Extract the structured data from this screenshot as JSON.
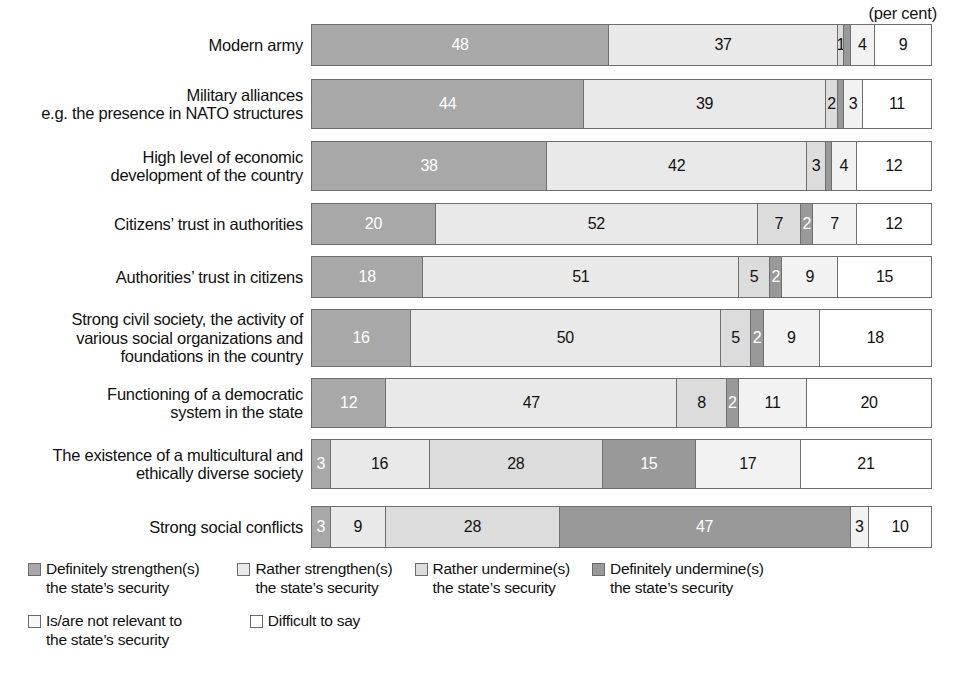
{
  "unit_note": "(per cent)",
  "chart_data": {
    "type": "bar",
    "orientation": "horizontal",
    "stacked": true,
    "normalized": true,
    "title": "",
    "subtitle": "",
    "xlabel": "",
    "ylabel": "",
    "unit": "(per cent)",
    "xlim": [
      0,
      100
    ],
    "grid": false,
    "legend_position": "bottom-left",
    "categories": [
      "Modern army",
      "Military alliances e.g. the presence in NATO structures",
      "High level of economic development of the country",
      "Citizens’ trust in authorities",
      "Authorities’ trust in citizens",
      "Strong civil society, the activity of various social organizations and foundations in the country",
      "Functioning of a democratic system in the state",
      "The existence of a multicultural and ethically diverse society",
      "Strong social conflicts"
    ],
    "series": [
      {
        "name": "Definitely strengthen(s) the state’s security",
        "color": "#a8a8a8",
        "values": [
          48,
          44,
          38,
          20,
          18,
          16,
          12,
          3,
          3
        ]
      },
      {
        "name": "Rather strengthen(s) the state’s security",
        "color": "#e9e9e9",
        "values": [
          37,
          39,
          42,
          52,
          51,
          50,
          47,
          16,
          9
        ]
      },
      {
        "name": "Rather undermine(s) the state’s security",
        "color": "#dcdcdc",
        "values": [
          1,
          2,
          3,
          7,
          5,
          5,
          8,
          28,
          28
        ]
      },
      {
        "name": "Definitely undermine(s) the state’s security",
        "color": "#999999",
        "values": [
          1,
          1,
          1,
          2,
          2,
          2,
          2,
          15,
          47
        ]
      },
      {
        "name": "Is/are not relevant to the state’s security",
        "color": "#f2f2f2",
        "values": [
          4,
          3,
          4,
          7,
          9,
          9,
          11,
          17,
          3
        ]
      },
      {
        "name": "Difficult to say",
        "color": "#ffffff",
        "values": [
          9,
          11,
          12,
          12,
          15,
          18,
          20,
          21,
          10
        ]
      }
    ]
  },
  "rows": [
    {
      "label_lines": [
        "Modern army"
      ],
      "segments": [
        {
          "value": 48,
          "label": "48",
          "series": 0
        },
        {
          "value": 37,
          "label": "37",
          "series": 1
        },
        {
          "value": 1,
          "label": "1",
          "series": 2
        },
        {
          "value": 1,
          "label": "",
          "series": 3
        },
        {
          "value": 4,
          "label": "4",
          "series": 4
        },
        {
          "value": 9,
          "label": "9",
          "series": 5
        }
      ]
    },
    {
      "label_lines": [
        "Military alliances",
        "e.g. the presence in NATO structures"
      ],
      "segments": [
        {
          "value": 44,
          "label": "44",
          "series": 0
        },
        {
          "value": 39,
          "label": "39",
          "series": 1
        },
        {
          "value": 2,
          "label": "2",
          "series": 2
        },
        {
          "value": 1,
          "label": "",
          "series": 3
        },
        {
          "value": 3,
          "label": "3",
          "series": 4
        },
        {
          "value": 11,
          "label": "11",
          "series": 5
        }
      ]
    },
    {
      "label_lines": [
        "High level of economic",
        "development of the country"
      ],
      "segments": [
        {
          "value": 38,
          "label": "38",
          "series": 0
        },
        {
          "value": 42,
          "label": "42",
          "series": 1
        },
        {
          "value": 3,
          "label": "3",
          "series": 2
        },
        {
          "value": 1,
          "label": "",
          "series": 3
        },
        {
          "value": 4,
          "label": "4",
          "series": 4
        },
        {
          "value": 12,
          "label": "12",
          "series": 5
        }
      ]
    },
    {
      "label_lines": [
        "Citizens’ trust in authorities"
      ],
      "segments": [
        {
          "value": 20,
          "label": "20",
          "series": 0
        },
        {
          "value": 52,
          "label": "52",
          "series": 1
        },
        {
          "value": 7,
          "label": "7",
          "series": 2
        },
        {
          "value": 2,
          "label": "2",
          "series": 3
        },
        {
          "value": 7,
          "label": "7",
          "series": 4
        },
        {
          "value": 12,
          "label": "12",
          "series": 5
        }
      ]
    },
    {
      "label_lines": [
        "Authorities’ trust in citizens"
      ],
      "segments": [
        {
          "value": 18,
          "label": "18",
          "series": 0
        },
        {
          "value": 51,
          "label": "51",
          "series": 1
        },
        {
          "value": 5,
          "label": "5",
          "series": 2
        },
        {
          "value": 2,
          "label": "2",
          "series": 3
        },
        {
          "value": 9,
          "label": "9",
          "series": 4
        },
        {
          "value": 15,
          "label": "15",
          "series": 5
        }
      ]
    },
    {
      "label_lines": [
        "Strong civil society, the activity of",
        "various social organizations and",
        "foundations in the country"
      ],
      "segments": [
        {
          "value": 16,
          "label": "16",
          "series": 0
        },
        {
          "value": 50,
          "label": "50",
          "series": 1
        },
        {
          "value": 5,
          "label": "5",
          "series": 2
        },
        {
          "value": 2,
          "label": "2",
          "series": 3
        },
        {
          "value": 9,
          "label": "9",
          "series": 4
        },
        {
          "value": 18,
          "label": "18",
          "series": 5
        }
      ]
    },
    {
      "label_lines": [
        "Functioning of a democratic",
        "system in the state"
      ],
      "segments": [
        {
          "value": 12,
          "label": "12",
          "series": 0
        },
        {
          "value": 47,
          "label": "47",
          "series": 1
        },
        {
          "value": 8,
          "label": "8",
          "series": 2
        },
        {
          "value": 2,
          "label": "2",
          "series": 3
        },
        {
          "value": 11,
          "label": "11",
          "series": 4
        },
        {
          "value": 20,
          "label": "20",
          "series": 5
        }
      ]
    },
    {
      "label_lines": [
        "The existence of a multicultural and",
        "ethically diverse society"
      ],
      "segments": [
        {
          "value": 3,
          "label": "3",
          "series": 0
        },
        {
          "value": 16,
          "label": "16",
          "series": 1
        },
        {
          "value": 28,
          "label": "28",
          "series": 2
        },
        {
          "value": 15,
          "label": "15",
          "series": 3
        },
        {
          "value": 17,
          "label": "17",
          "series": 4
        },
        {
          "value": 21,
          "label": "21",
          "series": 5
        }
      ]
    },
    {
      "label_lines": [
        "Strong social conflicts"
      ],
      "segments": [
        {
          "value": 3,
          "label": "3",
          "series": 0
        },
        {
          "value": 9,
          "label": "9",
          "series": 1
        },
        {
          "value": 28,
          "label": "28",
          "series": 2
        },
        {
          "value": 47,
          "label": "47",
          "series": 3
        },
        {
          "value": 3,
          "label": "3",
          "series": 4
        },
        {
          "value": 10,
          "label": "10",
          "series": 5
        }
      ]
    }
  ],
  "legend": {
    "row1": [
      {
        "swatch_name": "legend-swatch-definitely-strengthen",
        "color": "#a8a8a8",
        "lines": [
          "Definitely strengthen(s)",
          "the state’s security"
        ]
      },
      {
        "swatch_name": "legend-swatch-rather-strengthen",
        "color": "#e9e9e9",
        "lines": [
          "Rather strengthen(s)",
          "the state’s security"
        ]
      },
      {
        "swatch_name": "legend-swatch-rather-undermine",
        "color": "#dcdcdc",
        "lines": [
          "Rather undermine(s)",
          "the state’s security"
        ]
      },
      {
        "swatch_name": "legend-swatch-definitely-undermine",
        "color": "#999999",
        "lines": [
          "Definitely undermine(s)",
          "the state’s security"
        ]
      }
    ],
    "row2": [
      {
        "swatch_name": "legend-swatch-not-relevant",
        "color": "#f7f7f7",
        "lines": [
          "Is/are not relevant to",
          "the state’s security"
        ]
      },
      {
        "swatch_name": "legend-swatch-difficult-to-say",
        "color": "#ffffff",
        "lines": [
          "Difficult to say"
        ]
      }
    ]
  }
}
